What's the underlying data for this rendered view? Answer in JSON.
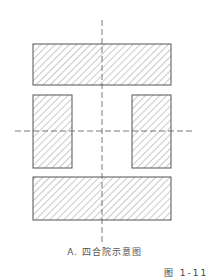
{
  "diagram": {
    "title": "四合院示意图",
    "caption": "A. 四合院示意图",
    "figure_label": "图 1-11",
    "colors": {
      "stroke": "#555555",
      "hatch": "#777777",
      "background": "#ffffff"
    },
    "blocks": [
      {
        "name": "north-building",
        "x": 33,
        "y": 44,
        "w": 138,
        "h": 41
      },
      {
        "name": "west-building",
        "x": 33,
        "y": 95,
        "w": 39,
        "h": 73
      },
      {
        "name": "east-building",
        "x": 132,
        "y": 95,
        "w": 39,
        "h": 73
      },
      {
        "name": "south-building",
        "x": 33,
        "y": 177,
        "w": 138,
        "h": 43
      }
    ],
    "axes": {
      "vertical": {
        "x": 102,
        "y1": 20,
        "y2": 243
      },
      "horizontal": {
        "y": 131,
        "x1": 15,
        "x2": 193
      }
    }
  }
}
